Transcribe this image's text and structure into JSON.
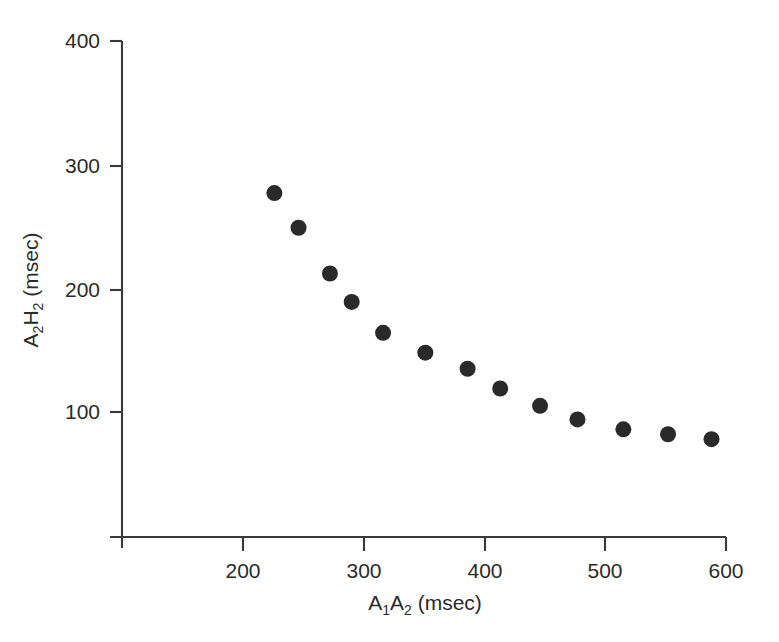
{
  "chart_data": {
    "type": "scatter",
    "title": "",
    "xlabel": "A1A2 (msec)",
    "ylabel": "A2H2 (msec)",
    "xlabel_parts": {
      "base1": "A",
      "sub1": "1",
      "base2": "A",
      "sub2": "2",
      "units": " (msec)"
    },
    "ylabel_parts": {
      "base1": "A",
      "sub1": "2",
      "base2": "H",
      "sub2": "2",
      "units": " (msec)"
    },
    "xlim": [
      110,
      600
    ],
    "ylim": [
      0,
      400
    ],
    "xticks": [
      200,
      300,
      400,
      500,
      600
    ],
    "xtick_labels": [
      "200",
      "300",
      "400",
      "500",
      "600"
    ],
    "yticks": [
      100,
      200,
      300,
      400
    ],
    "ytick_labels": [
      "100",
      "200",
      "300",
      "400"
    ],
    "grid": false,
    "legend": null,
    "marker_color": "#2a2a2a",
    "marker_size_px": 16,
    "axis_color": "#3a3a3a",
    "background_color": "#ffffff",
    "series": [
      {
        "name": "A2H2 vs A1A2",
        "x": [
          226,
          246,
          272,
          290,
          316,
          351,
          386,
          413,
          446,
          477,
          515,
          552,
          588
        ],
        "y": [
          277,
          249,
          212,
          189,
          164,
          148,
          135,
          119,
          105,
          94,
          86,
          82,
          78
        ]
      }
    ]
  }
}
